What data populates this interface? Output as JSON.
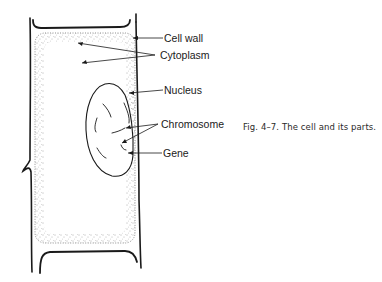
{
  "figure": {
    "caption_number": "Fig. 4–7.",
    "caption_text": "The cell and its parts.",
    "labels": {
      "cell_wall": "Cell wall",
      "cytoplasm": "Cytoplasm",
      "nucleus": "Nucleus",
      "chromosome": "Chromosome",
      "gene": "Gene"
    },
    "colors": {
      "ink": "#1a1a1a",
      "background": "#ffffff",
      "stipple": "#555555"
    }
  }
}
